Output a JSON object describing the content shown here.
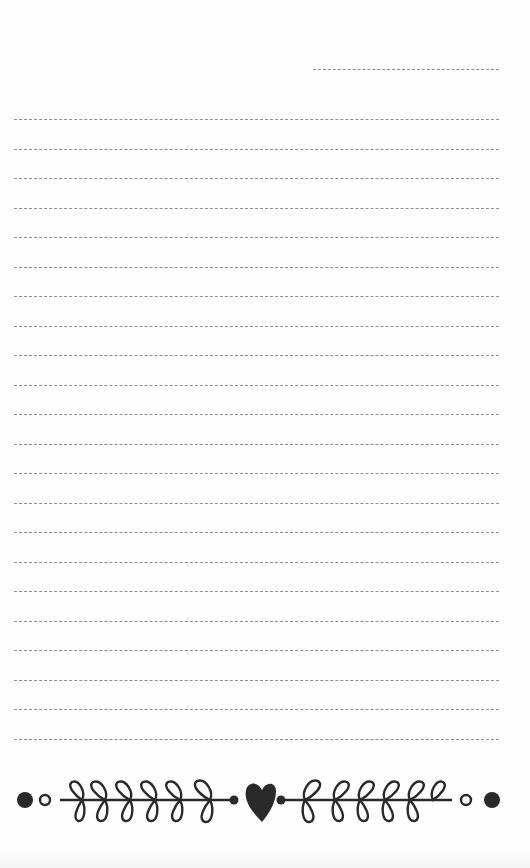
{
  "document": {
    "type": "lined notepaper",
    "date_line": {
      "x": 313,
      "y": 69,
      "width": 186
    },
    "writing_lines": {
      "count": 22,
      "first_y": 119,
      "spacing": 29.5,
      "x": 14,
      "width": 485,
      "content": [
        "",
        "",
        "",
        "",
        "",
        "",
        "",
        "",
        "",
        "",
        "",
        "",
        "",
        "",
        "",
        "",
        "",
        "",
        "",
        "",
        "",
        ""
      ]
    },
    "colors": {
      "paper": "#fefefe",
      "line": "#8e8e8e",
      "ornament": "#2a2a2a"
    },
    "ornament": {
      "description": "heart-with-laurel-vines-border",
      "elements": [
        "filled-dot",
        "hollow-dot",
        "left-vine",
        "heart",
        "right-vine",
        "hollow-dot",
        "filled-dot"
      ]
    }
  }
}
